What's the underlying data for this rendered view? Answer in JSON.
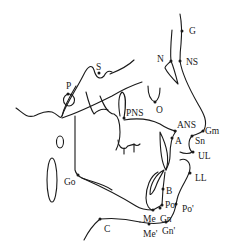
{
  "diagram": {
    "type": "cephalometric-landmark-tracing",
    "line_color": "#1a1a1a",
    "background": "#ffffff",
    "landmarks": {
      "G": {
        "label": "G",
        "x": 182,
        "y": 31,
        "lx": 189,
        "ly": 34
      },
      "N": {
        "label": "N",
        "x": 171,
        "y": 61,
        "lx": 157,
        "ly": 62
      },
      "NS": {
        "label": "NS",
        "x": 180,
        "y": 61,
        "lx": 186,
        "ly": 65
      },
      "S": {
        "label": "S",
        "x": 99,
        "y": 73,
        "lx": 96,
        "ly": 70
      },
      "P": {
        "label": "P",
        "x": 68,
        "y": 94,
        "lx": 66,
        "ly": 89
      },
      "O": {
        "label": "O",
        "x": 155,
        "y": 102,
        "lx": 156,
        "ly": 113
      },
      "PNS": {
        "label": "PNS",
        "x": 124,
        "y": 118,
        "lx": 126,
        "ly": 116
      },
      "ANS": {
        "label": "ANS",
        "x": 175,
        "y": 131,
        "lx": 177,
        "ly": 128
      },
      "Gm": {
        "label": "Gm",
        "x": 203,
        "y": 131,
        "lx": 205,
        "ly": 134
      },
      "A": {
        "label": "A",
        "x": 172,
        "y": 138,
        "lx": 175,
        "ly": 144
      },
      "Sn": {
        "label": "Sn",
        "x": 192,
        "y": 136,
        "lx": 195,
        "ly": 144
      },
      "UL": {
        "label": "UL",
        "x": 193,
        "y": 152,
        "lx": 198,
        "ly": 159
      },
      "LL": {
        "label": "LL",
        "x": 190,
        "y": 173,
        "lx": 195,
        "ly": 181
      },
      "Go": {
        "label": "Go",
        "x": 78,
        "y": 175,
        "lx": 64,
        "ly": 185
      },
      "B": {
        "label": "B",
        "x": 163,
        "y": 189,
        "lx": 166,
        "ly": 194
      },
      "Po": {
        "label": "Po",
        "x": 162,
        "y": 205,
        "lx": 165,
        "ly": 208
      },
      "Po'": {
        "label": "Po'",
        "x": 176,
        "y": 204,
        "lx": 182,
        "ly": 212
      },
      "Me": {
        "label": "Me",
        "x": 153,
        "y": 210,
        "lx": 143,
        "ly": 222
      },
      "Gn": {
        "label": "Gn",
        "x": 160,
        "y": 208,
        "lx": 160,
        "ly": 222
      },
      "Me'": {
        "label": "Me'",
        "x": 149,
        "y": 224,
        "lx": 143,
        "ly": 237
      },
      "Gn'": {
        "label": "Gn'",
        "x": 166,
        "y": 222,
        "lx": 162,
        "ly": 234
      },
      "C": {
        "label": "C",
        "x": 100,
        "y": 219,
        "lx": 104,
        "ly": 232
      }
    }
  }
}
